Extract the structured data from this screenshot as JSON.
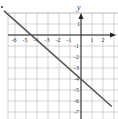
{
  "chart_data": {
    "type": "line",
    "title": "",
    "xlabel": "",
    "ylabel": "y",
    "xlim": [
      -7,
      3.2
    ],
    "ylim": [
      -8,
      2
    ],
    "grid": true,
    "x_ticks": [
      "-6",
      "-5",
      "-4",
      "-3",
      "-2",
      "-1",
      "1",
      "2"
    ],
    "y_ticks": [
      "1",
      "-1",
      "-2",
      "-3",
      "-4",
      "-5",
      "-6",
      "-7"
    ],
    "series": [
      {
        "name": "line",
        "x": [
          -7,
          2.8
        ],
        "y": [
          2.2,
          -6.5
        ],
        "equation": "y = -(8/9)x - 4",
        "color": "#555555"
      }
    ],
    "x_intercept": -4.5,
    "y_intercept": -4
  },
  "bullet": "•",
  "colors": {
    "grid": "#bbbbbb",
    "axis": "#222222",
    "line": "#555555"
  }
}
